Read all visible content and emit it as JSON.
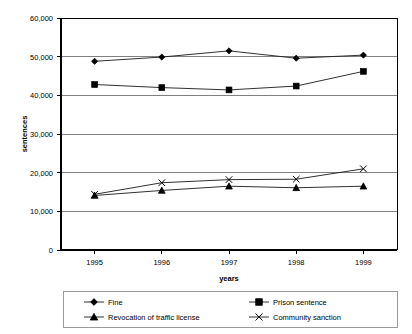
{
  "chart_data": {
    "type": "line",
    "title": "",
    "subtitle": "",
    "xlabel": "years",
    "ylabel": "sentences",
    "categories": [
      "1995",
      "1996",
      "1997",
      "1998",
      "1999"
    ],
    "x": [
      1995,
      1996,
      1997,
      1998,
      1999
    ],
    "ylim": [
      0,
      60000
    ],
    "yticks": [
      0,
      10000,
      20000,
      30000,
      40000,
      50000,
      60000
    ],
    "ytick_labels": [
      "0",
      "10,000",
      "20,000",
      "30,000",
      "40,000",
      "50,000",
      "60,000"
    ],
    "grid": true,
    "grid_axis": "y",
    "legend_position": "bottom",
    "series": [
      {
        "name": "Fine",
        "marker": "diamond",
        "values": [
          48800,
          49900,
          51500,
          49600,
          50400
        ]
      },
      {
        "name": "Prison sentence",
        "marker": "square",
        "values": [
          42800,
          42000,
          41400,
          42400,
          46200
        ]
      },
      {
        "name": "Revocation of traffic license",
        "marker": "triangle",
        "values": [
          14100,
          15400,
          16500,
          16100,
          16500
        ]
      },
      {
        "name": "Community sanction",
        "marker": "x",
        "values": [
          14400,
          17400,
          18200,
          18300,
          21000
        ]
      }
    ]
  },
  "axes": {
    "y_title": "sentences",
    "x_title": "years",
    "y_tick_0": "0",
    "y_tick_1": "10,000",
    "y_tick_2": "20,000",
    "y_tick_3": "30,000",
    "y_tick_4": "40,000",
    "y_tick_5": "50,000",
    "y_tick_6": "60,000",
    "x_tick_0": "1995",
    "x_tick_1": "1996",
    "x_tick_2": "1997",
    "x_tick_3": "1998",
    "x_tick_4": "1999"
  },
  "legend": {
    "entry_0": "Fine",
    "entry_1": "Prison sentence",
    "entry_2": "Revocation of traffic license",
    "entry_3": "Community sanction"
  },
  "colors": {
    "series": "#000000",
    "grid": "#808080",
    "axis": "#000000",
    "background": "#ffffff",
    "legend_border": "#9a9a9a"
  }
}
